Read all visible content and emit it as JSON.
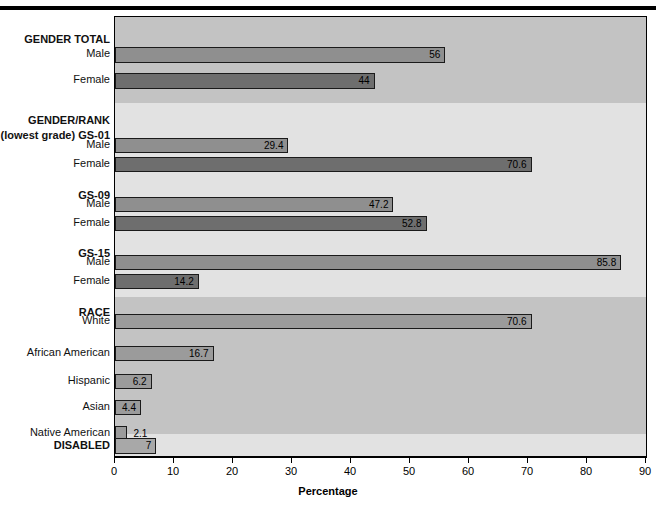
{
  "chart_data": {
    "type": "bar",
    "orientation": "horizontal",
    "title": "",
    "xlabel": "Percentage",
    "ylabel": "",
    "xlim": [
      0,
      90
    ],
    "xticks": [
      0,
      10,
      20,
      30,
      40,
      50,
      60,
      70,
      80,
      90
    ],
    "grid": false,
    "legend": null,
    "value_labels": true,
    "groups": [
      {
        "name": "GENDER TOTAL",
        "band": "dark",
        "rows": [
          {
            "label": "Male",
            "value": 56,
            "display": "56",
            "series": "male"
          },
          {
            "label": "Female",
            "value": 44,
            "display": "44",
            "series": "female"
          }
        ]
      },
      {
        "name": "GENDER/RANK",
        "subtitle": "(lowest grade) GS-01",
        "band": "light",
        "rows": [
          {
            "label": "Male",
            "value": 29.4,
            "display": "29.4",
            "series": "male"
          },
          {
            "label": "Female",
            "value": 70.6,
            "display": "70.6",
            "series": "female"
          }
        ]
      },
      {
        "name": "GS-09",
        "band": "light",
        "rows": [
          {
            "label": "Male",
            "value": 47.2,
            "display": "47.2",
            "series": "male"
          },
          {
            "label": "Female",
            "value": 52.8,
            "display": "52.8",
            "series": "female"
          }
        ]
      },
      {
        "name": "GS-15",
        "band": "light",
        "rows": [
          {
            "label": "Male",
            "value": 85.8,
            "display": "85.8",
            "series": "male"
          },
          {
            "label": "Female",
            "value": 14.2,
            "display": "14.2",
            "series": "female"
          }
        ]
      },
      {
        "name": "RACE",
        "band": "dark",
        "rows": [
          {
            "label": "White",
            "value": 70.6,
            "display": "70.6",
            "series": "plain"
          },
          {
            "label": "African American",
            "value": 16.7,
            "display": "16.7",
            "series": "plain"
          },
          {
            "label": "Hispanic",
            "value": 6.2,
            "display": "6.2",
            "series": "plain"
          },
          {
            "label": "Asian",
            "value": 4.4,
            "display": "4.4",
            "series": "plain"
          },
          {
            "label": "Native American",
            "value": 2.1,
            "display": "2.1",
            "series": "plain",
            "label_outside": true
          }
        ]
      },
      {
        "name": "DISABLED",
        "band": "light",
        "rows": [
          {
            "label": "",
            "value": 7,
            "display": "7",
            "series": "light"
          }
        ]
      }
    ]
  },
  "axis": {
    "tick_labels": [
      "0",
      "10",
      "20",
      "30",
      "40",
      "50",
      "60",
      "70",
      "80",
      "90"
    ],
    "x_title": "Percentage"
  },
  "labels": {
    "gender_total": "GENDER TOTAL",
    "gender_rank": "GENDER/RANK",
    "gs01": "(lowest grade) GS-01",
    "gs09": "GS-09",
    "gs15": "GS-15",
    "race": "RACE",
    "disabled": "DISABLED",
    "male": "Male",
    "female": "Female",
    "white": "White",
    "african_american": "African American",
    "hispanic": "Hispanic",
    "asian": "Asian",
    "native_american": "Native American"
  },
  "colors": {
    "band_dark": "#c3c3c3",
    "band_light": "#e2e2e2",
    "plot_bg": "#d9d9d9",
    "bar_male": "#8f8f8f",
    "bar_female": "#6e6e6e",
    "bar_plain": "#9b9b9b",
    "bar_light": "#a8a8a8",
    "outline": "#1a1a1a"
  }
}
